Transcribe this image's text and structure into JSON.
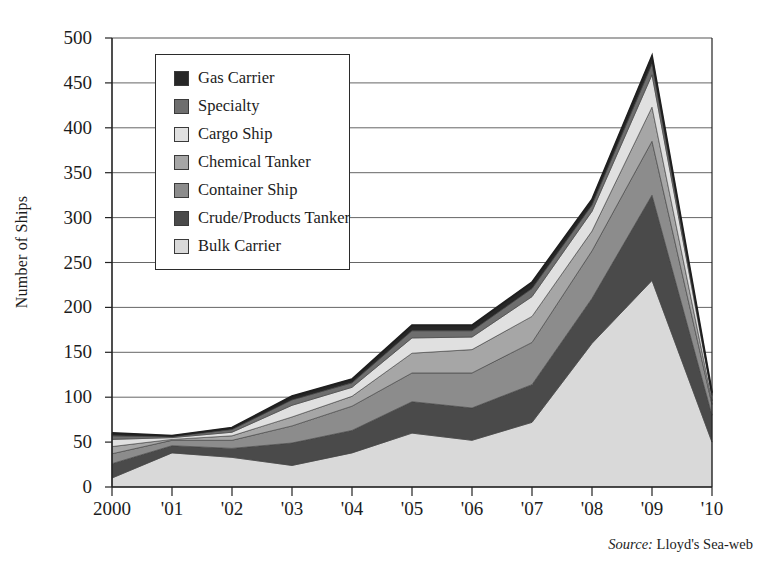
{
  "chart_data": {
    "type": "area",
    "stacked": true,
    "title": "",
    "xlabel": "",
    "ylabel": "Number of Ships",
    "ylim": [
      0,
      500
    ],
    "ytick_step": 50,
    "grid": true,
    "legend_position": "inside-top-left",
    "source_prefix": "Source:",
    "source_text": "Lloyd's Sea-web",
    "categories": [
      "2000",
      "'01",
      "'02",
      "'03",
      "'04",
      "'05",
      "'06",
      "'07",
      "'08",
      "'09",
      "'10"
    ],
    "x": [
      2000,
      2001,
      2002,
      2003,
      2004,
      2005,
      2006,
      2007,
      2008,
      2009,
      2010
    ],
    "yticks": [
      0,
      50,
      100,
      150,
      200,
      250,
      300,
      350,
      400,
      450,
      500
    ],
    "series": [
      {
        "name": "Bulk Carrier",
        "color": "#d9d9d9",
        "values": [
          10,
          38,
          33,
          24,
          38,
          60,
          52,
          72,
          160,
          230,
          50
        ]
      },
      {
        "name": "Crude/Products Tanker",
        "color": "#4a4a4a",
        "values": [
          16,
          8,
          10,
          25,
          25,
          35,
          36,
          42,
          50,
          95,
          30
        ]
      },
      {
        "name": "Container Ship",
        "color": "#8c8c8c",
        "values": [
          11,
          6,
          9,
          19,
          27,
          32,
          39,
          47,
          53,
          60,
          12
        ]
      },
      {
        "name": "Chemical Tanker",
        "color": "#a6a6a6",
        "values": [
          8,
          1,
          5,
          10,
          11,
          22,
          26,
          29,
          22,
          38,
          4
        ]
      },
      {
        "name": "Cargo Ship",
        "color": "#e0e0e0",
        "values": [
          8,
          2,
          4,
          13,
          10,
          17,
          14,
          22,
          22,
          36,
          6
        ]
      },
      {
        "name": "Specialty",
        "color": "#6e6e6e",
        "values": [
          4,
          1,
          3,
          6,
          5,
          8,
          7,
          9,
          7,
          12,
          2
        ]
      },
      {
        "name": "Gas Carrier",
        "color": "#272727",
        "values": [
          3,
          1,
          2,
          4,
          4,
          6,
          6,
          7,
          6,
          9,
          1
        ]
      }
    ],
    "totals": [
      60,
      57,
      66,
      101,
      120,
      180,
      180,
      228,
      320,
      480,
      105
    ]
  },
  "legend": {
    "items": [
      {
        "label": "Gas Carrier",
        "color": "#272727"
      },
      {
        "label": "Specialty",
        "color": "#6e6e6e"
      },
      {
        "label": "Cargo Ship",
        "color": "#e0e0e0"
      },
      {
        "label": "Chemical Tanker",
        "color": "#a6a6a6"
      },
      {
        "label": "Container Ship",
        "color": "#8c8c8c"
      },
      {
        "label": "Crude/Products Tanker",
        "color": "#4a4a4a"
      },
      {
        "label": "Bulk Carrier",
        "color": "#d9d9d9"
      }
    ]
  },
  "axes": {
    "y_title": "Number of Ships",
    "y_labels": [
      "500",
      "450",
      "400",
      "350",
      "300",
      "250",
      "200",
      "150",
      "100",
      "50",
      "0"
    ],
    "x_labels": [
      "2000",
      "'01",
      "'02",
      "'03",
      "'04",
      "'05",
      "'06",
      "'07",
      "'08",
      "'09",
      "'10"
    ]
  },
  "footer": {
    "source_prefix": "Source:",
    "source_value": "Lloyd's Sea-web"
  }
}
